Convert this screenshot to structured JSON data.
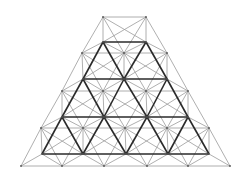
{
  "diagram": {
    "title": "",
    "colors": {
      "background": "#ffffff",
      "bold_members": "#2a2a2a",
      "light_members": "#9a9a9a"
    },
    "top_layer_rows": [
      {
        "y": 42,
        "x": [
          103,
          146
        ]
      },
      {
        "y": 79,
        "x": [
          83,
          124,
          167
        ]
      },
      {
        "y": 117,
        "x": [
          62,
          104,
          147,
          188
        ]
      },
      {
        "y": 154,
        "x": [
          42,
          83,
          126,
          168,
          209
        ]
      }
    ],
    "bottom_layer_rows": [
      {
        "y": 17,
        "x": [
          103,
          146
        ]
      },
      {
        "y": 53,
        "x": [
          82,
          124,
          167
        ]
      },
      {
        "y": 91,
        "x": [
          62,
          103,
          146,
          188
        ]
      },
      {
        "y": 128,
        "x": [
          41,
          83,
          125,
          167,
          209
        ]
      },
      {
        "y": 166,
        "x": [
          21,
          62,
          104,
          147,
          188,
          230
        ]
      }
    ]
  }
}
